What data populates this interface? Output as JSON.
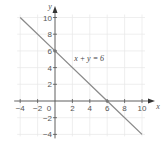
{
  "chart_data": {
    "type": "line",
    "title": "",
    "xlabel": "x",
    "ylabel": "y",
    "xlim": [
      -4,
      10
    ],
    "ylim": [
      -4,
      10
    ],
    "grid": true,
    "x_ticks": [
      -4,
      -2,
      0,
      2,
      4,
      6,
      8,
      10
    ],
    "y_ticks": [
      -4,
      -2,
      2,
      4,
      6,
      8,
      10
    ],
    "x_tick_labels": [
      "−4",
      "−2",
      "0",
      "2",
      "4",
      "6",
      "8",
      "10"
    ],
    "y_tick_labels": [
      "−4",
      "−2",
      "2",
      "4",
      "6",
      "8",
      "10"
    ],
    "series": [
      {
        "name": "x + y = 6",
        "x": [
          -4,
          0,
          6,
          10
        ],
        "y": [
          10,
          6,
          0,
          -4
        ]
      }
    ],
    "annotations": [
      {
        "text": "x + y = 6",
        "x": 2.2,
        "y": 4.8
      }
    ],
    "marked_points": [
      {
        "x": 0,
        "y": 6
      },
      {
        "x": 6,
        "y": 0
      }
    ],
    "colors": {
      "line": "#8a8a8a",
      "axis": "#555555",
      "grid": "#e6e6e6"
    }
  }
}
